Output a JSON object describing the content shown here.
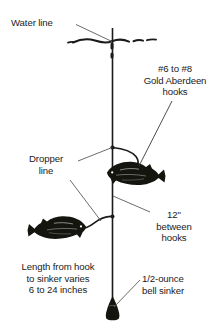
{
  "diagram": {
    "background_color": "#ffffff",
    "ink_color": "#1b1b1b",
    "labels": {
      "water_line": "Water line",
      "hooks": "#6 to #8\nGold Aberdeen\nhooks",
      "dropper_line": "Dropper\nline",
      "hook_spacing": "12\"\nbetween\nhooks",
      "length_to_sinker": "Length from hook\nto sinker varies\n6 to 24 inches",
      "bell_sinker": "1/2-ounce\nbell sinker"
    },
    "parts": {
      "main_line": "main-line",
      "water_surface": "water-surface-line",
      "upper_fish": "upper-fish",
      "lower_fish": "lower-fish",
      "upper_dropper": "upper-dropper-line",
      "lower_dropper": "lower-dropper-line",
      "sinker": "bell-sinker"
    }
  }
}
